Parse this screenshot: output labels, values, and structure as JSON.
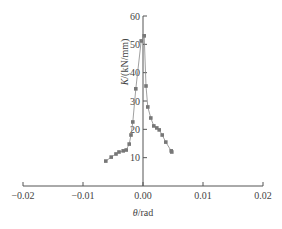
{
  "chart_data": {
    "type": "line",
    "title": "",
    "xlabel": "θ/rad",
    "ylabel": "K/(kN/mm)",
    "xlim": [
      -0.02,
      0.02
    ],
    "ylim": [
      0,
      60
    ],
    "x_ticks": [
      -0.02,
      -0.01,
      0.0,
      0.01,
      0.02
    ],
    "x_tick_labels": [
      "−0.02",
      "−0.01",
      "0.00",
      "0.01",
      "0.02"
    ],
    "y_ticks": [
      10,
      20,
      30,
      40,
      50,
      60
    ],
    "y_tick_labels": [
      "10",
      "20",
      "30",
      "40",
      "50",
      "60"
    ],
    "grid": false,
    "legend": null,
    "series": [
      {
        "name": "negative-branch",
        "color": "#777777",
        "marker": "square",
        "points": [
          [
            -0.0062,
            8.8
          ],
          [
            -0.0053,
            10.2
          ],
          [
            -0.0045,
            11.3
          ],
          [
            -0.004,
            12.0
          ],
          [
            -0.0033,
            12.4
          ],
          [
            -0.0028,
            12.7
          ],
          [
            -0.0023,
            14.8
          ],
          [
            -0.002,
            18.0
          ],
          [
            -0.0017,
            22.6
          ],
          [
            -0.0012,
            34.3
          ],
          [
            -0.0003,
            51.2
          ]
        ]
      },
      {
        "name": "positive-branch",
        "color": "#777777",
        "marker": "square",
        "points": [
          [
            0.0002,
            53.0
          ],
          [
            0.0005,
            35.3
          ],
          [
            0.0008,
            27.9
          ],
          [
            0.0013,
            24.0
          ],
          [
            0.0018,
            21.2
          ],
          [
            0.0023,
            20.5
          ],
          [
            0.0027,
            19.8
          ],
          [
            0.0032,
            18.0
          ],
          [
            0.0038,
            15.5
          ],
          [
            0.0047,
            12.4
          ],
          [
            0.0048,
            12.0
          ]
        ]
      }
    ]
  },
  "labels": {
    "xlabel_theta": "θ",
    "xlabel_unit": "/rad",
    "ylabel_k": "K",
    "ylabel_unit": "/(kN/mm)"
  }
}
